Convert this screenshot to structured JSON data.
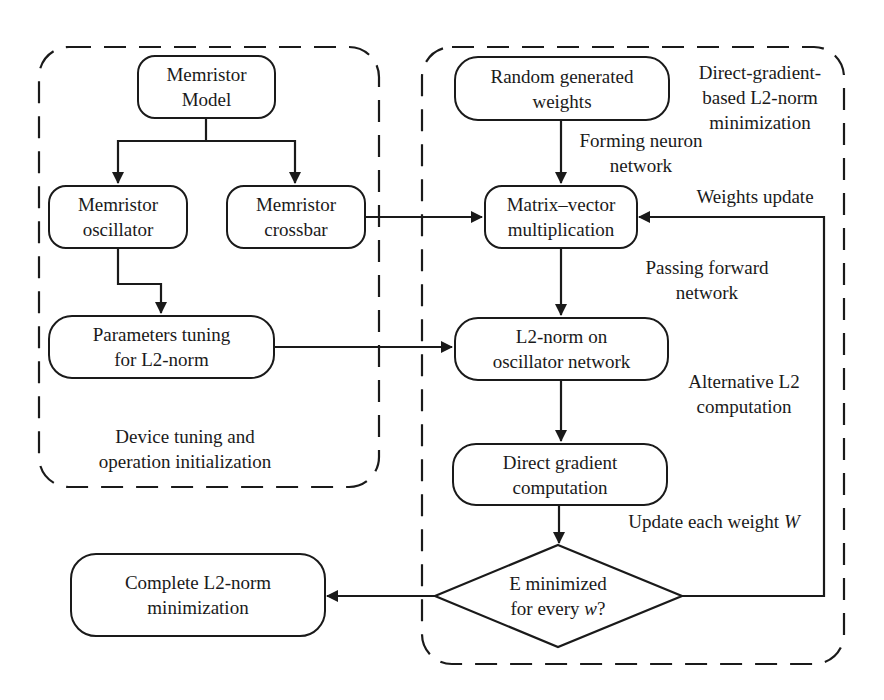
{
  "diagram": {
    "type": "flowchart",
    "groups": {
      "device_tuning": {
        "label_line1": "Device tuning and",
        "label_line2": "operation initialization"
      },
      "direct_gradient": {
        "label_line1": "Direct-gradient-",
        "label_line2": "based L2-norm",
        "label_line3": "minimization"
      }
    },
    "nodes": {
      "memristor_model": {
        "line1": "Memristor",
        "line2": "Model"
      },
      "memristor_oscillator": {
        "line1": "Memristor",
        "line2": "oscillator"
      },
      "memristor_crossbar": {
        "line1": "Memristor",
        "line2": "crossbar"
      },
      "parameters_tuning": {
        "line1": "Parameters tuning",
        "line2": "for L2-norm"
      },
      "random_weights": {
        "line1": "Random generated",
        "line2": "weights"
      },
      "matrix_vector": {
        "line1": "Matrix–vector",
        "line2": "multiplication"
      },
      "l2_norm": {
        "line1": "L2-norm on",
        "line2": "oscillator network"
      },
      "direct_gradient": {
        "line1": "Direct gradient",
        "line2": "computation"
      },
      "decision": {
        "line1": "E minimized",
        "line2_prefix": "for every ",
        "line2_var": "w",
        "line2_suffix": "?"
      },
      "complete": {
        "line1": "Complete L2-norm",
        "line2": "minimization"
      }
    },
    "edge_labels": {
      "forming": {
        "line1": "Forming neuron",
        "line2": "network"
      },
      "weights_update": {
        "line1": "Weights update"
      },
      "passing": {
        "line1": "Passing forward",
        "line2": "network"
      },
      "alternative": {
        "line1": "Alternative L2",
        "line2": "computation"
      },
      "update_each": {
        "prefix": "Update each weight ",
        "var": "W"
      }
    },
    "edges": [
      {
        "from": "Memristor Model",
        "to": "Memristor oscillator"
      },
      {
        "from": "Memristor Model",
        "to": "Memristor crossbar"
      },
      {
        "from": "Memristor oscillator",
        "to": "Parameters tuning for L2-norm"
      },
      {
        "from": "Memristor crossbar",
        "to": "Matrix–vector multiplication"
      },
      {
        "from": "Parameters tuning for L2-norm",
        "to": "L2-norm on oscillator network"
      },
      {
        "from": "Random generated weights",
        "to": "Matrix–vector multiplication",
        "label": "Forming neuron network"
      },
      {
        "from": "Matrix–vector multiplication",
        "to": "L2-norm on oscillator network",
        "label": "Passing forward network"
      },
      {
        "from": "L2-norm on oscillator network",
        "to": "Direct gradient computation",
        "label": "Alternative L2 computation"
      },
      {
        "from": "Direct gradient computation",
        "to": "E minimized for every w?",
        "label": "Update each weight W"
      },
      {
        "from": "E minimized for every w?",
        "to": "Matrix–vector multiplication",
        "label": "Weights update"
      },
      {
        "from": "E minimized for every w?",
        "to": "Complete L2-norm minimization"
      }
    ],
    "colors": {
      "stroke": "#1a1a1a",
      "background": "#ffffff"
    }
  }
}
